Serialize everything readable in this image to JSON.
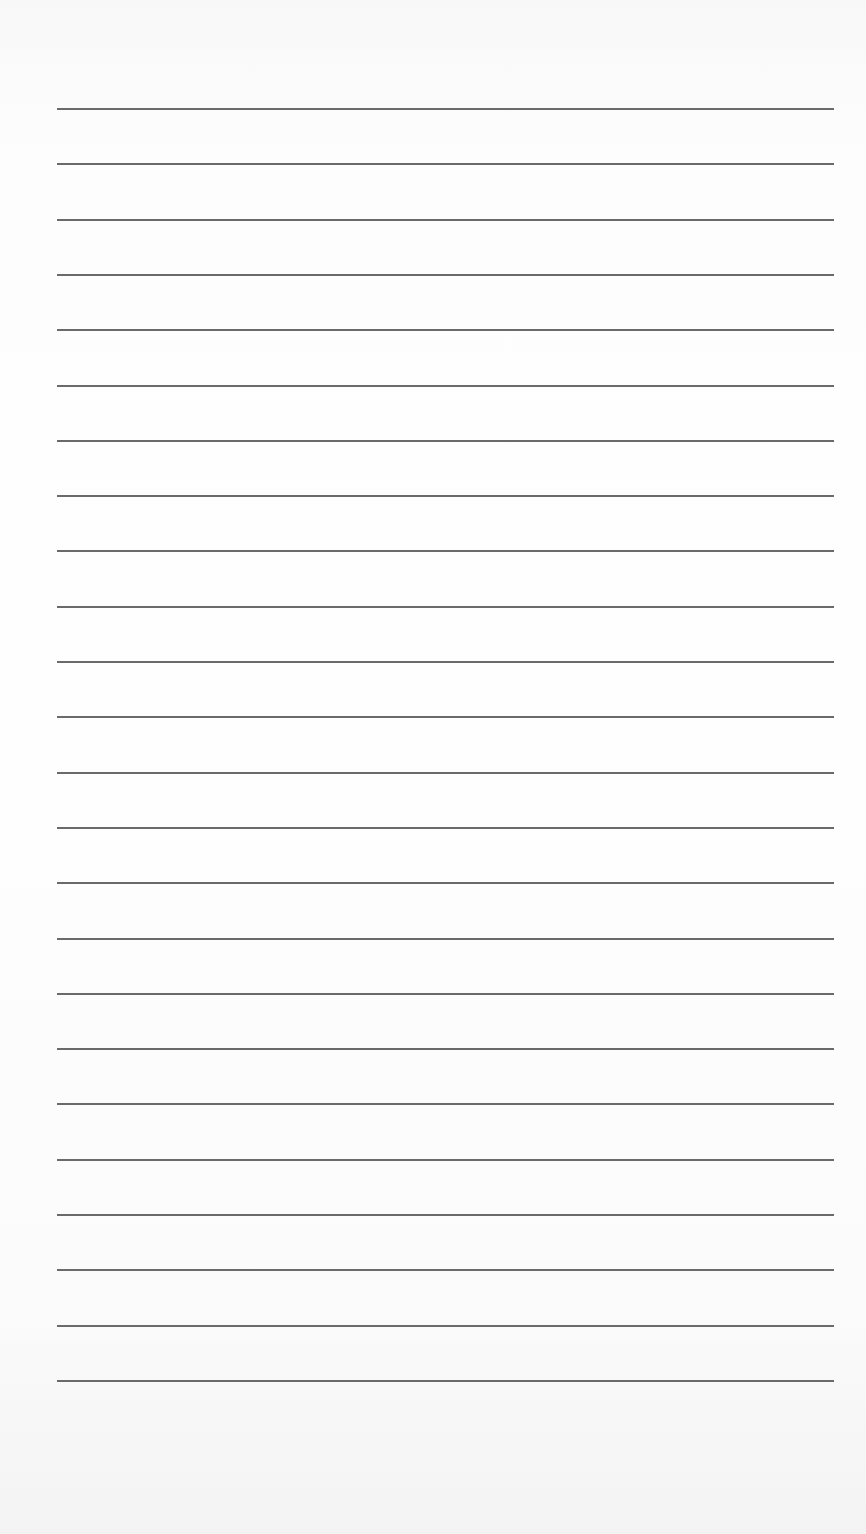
{
  "document": {
    "type": "lined-paper",
    "background_color": "#fbfbfb",
    "rule_color": "#5a5a5a",
    "rule_count": 24,
    "rule_left_px": 57,
    "rule_right_px": 834,
    "first_rule_y_px": 108,
    "rule_spacing_px": 55.3,
    "lines": [
      {
        "index": 1,
        "text": ""
      },
      {
        "index": 2,
        "text": ""
      },
      {
        "index": 3,
        "text": ""
      },
      {
        "index": 4,
        "text": ""
      },
      {
        "index": 5,
        "text": ""
      },
      {
        "index": 6,
        "text": ""
      },
      {
        "index": 7,
        "text": ""
      },
      {
        "index": 8,
        "text": ""
      },
      {
        "index": 9,
        "text": ""
      },
      {
        "index": 10,
        "text": ""
      },
      {
        "index": 11,
        "text": ""
      },
      {
        "index": 12,
        "text": ""
      },
      {
        "index": 13,
        "text": ""
      },
      {
        "index": 14,
        "text": ""
      },
      {
        "index": 15,
        "text": ""
      },
      {
        "index": 16,
        "text": ""
      },
      {
        "index": 17,
        "text": ""
      },
      {
        "index": 18,
        "text": ""
      },
      {
        "index": 19,
        "text": ""
      },
      {
        "index": 20,
        "text": ""
      },
      {
        "index": 21,
        "text": ""
      },
      {
        "index": 22,
        "text": ""
      },
      {
        "index": 23,
        "text": ""
      },
      {
        "index": 24,
        "text": ""
      }
    ]
  }
}
